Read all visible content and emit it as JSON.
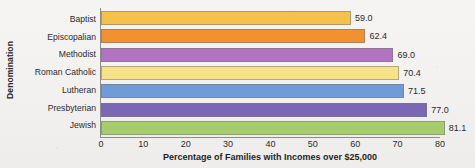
{
  "chart_data": {
    "type": "bar",
    "orientation": "horizontal",
    "title": "",
    "xlabel": "Percentage of Families with Incomes over $25,000",
    "ylabel": "Denomination",
    "categories": [
      "Baptist",
      "Episcopalian",
      "Methodist",
      "Roman Catholic",
      "Lutheran",
      "Presbyterian",
      "Jewish"
    ],
    "values": [
      59.0,
      62.4,
      69.0,
      70.4,
      71.5,
      77.0,
      81.1
    ],
    "value_labels": [
      "59.0",
      "62.4",
      "69.0",
      "70.4",
      "71.5",
      "77.0",
      "81.1"
    ],
    "bar_colors": [
      "#f4c14c",
      "#f2912f",
      "#b273c0",
      "#f6e288",
      "#6f9bd6",
      "#7a68b5",
      "#a7cc6e"
    ],
    "xlim": [
      0,
      80
    ],
    "ylim": null,
    "xticks": [
      0,
      10,
      20,
      30,
      40,
      50,
      60,
      70,
      80
    ],
    "xtick_labels": [
      "0",
      "10",
      "20",
      "30",
      "40",
      "50",
      "60",
      "70",
      "80"
    ],
    "grid": false,
    "legend": false,
    "legend_position": "none"
  }
}
